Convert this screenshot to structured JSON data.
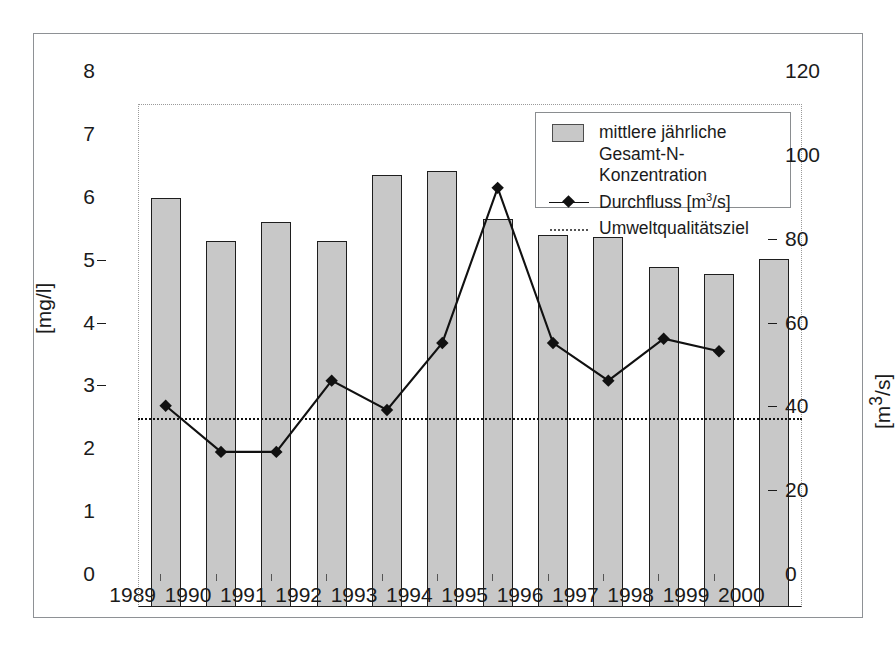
{
  "chart_data": {
    "type": "bar",
    "title": "",
    "subtitle": "",
    "xlabel": "",
    "ylabel": "[mg/l]",
    "ylabel_secondary": "[m³/s]",
    "categories": [
      "1989",
      "1990",
      "1991",
      "1992",
      "1993",
      "1994",
      "1995",
      "1996",
      "1997",
      "1998",
      "1999",
      "2000"
    ],
    "ylim": [
      0,
      8
    ],
    "yticks": [
      "0",
      "1",
      "2",
      "3",
      "4",
      "5",
      "6",
      "7",
      "8"
    ],
    "ylim_secondary": [
      0,
      120
    ],
    "yticks_secondary": [
      "0",
      "20",
      "40",
      "60",
      "80",
      "100",
      "120"
    ],
    "grid": false,
    "legend_position": "top-right",
    "series": [
      {
        "name": "mittlere jährliche Gesamt-N-Konzentration",
        "type": "bar",
        "axis": "left",
        "unit": "mg/l",
        "color": "#c8c8c8",
        "edge_color": "#1e1e1e",
        "values": [
          6.5,
          5.82,
          6.12,
          5.82,
          6.87,
          6.93,
          6.17,
          5.92,
          5.89,
          5.4,
          5.29,
          5.54
        ]
      },
      {
        "name": "Durchfluss [m³/s]",
        "type": "line",
        "axis": "right",
        "unit": "m³/s",
        "color": "#111111",
        "marker": "diamond",
        "values": [
          48,
          37,
          37,
          54,
          47,
          63,
          100,
          63,
          54,
          64,
          61,
          null
        ]
      },
      {
        "name": "Umweltqualitätsziel",
        "type": "threshold-line",
        "axis": "left",
        "unit": "mg/l",
        "color": "#111111",
        "style": "dotted",
        "value": 3.0
      }
    ],
    "annotations": []
  },
  "legend": {
    "entries": [
      {
        "label": "mittlere jährliche\nGesamt-N-Konzentration",
        "key": "filled-square-swatch"
      },
      {
        "label": "Durchfluss [m³/s]",
        "key": "line-with-diamond-marker"
      },
      {
        "label": "Umweltqualitätsziel",
        "key": "dotted-line"
      }
    ]
  },
  "axes": {
    "left": {
      "title": "[mg/l]",
      "ticks": [
        "8",
        "7",
        "6",
        "5",
        "4",
        "3",
        "2",
        "1",
        "0"
      ]
    },
    "right": {
      "title": "[m³/s]",
      "ticks": [
        "120",
        "100",
        "80",
        "60",
        "40",
        "20",
        "0"
      ]
    },
    "bottom": {
      "ticks": [
        "1989",
        "1990",
        "1991",
        "1992",
        "1993",
        "1994",
        "1995",
        "1996",
        "1997",
        "1998",
        "1999",
        "2000"
      ]
    }
  }
}
